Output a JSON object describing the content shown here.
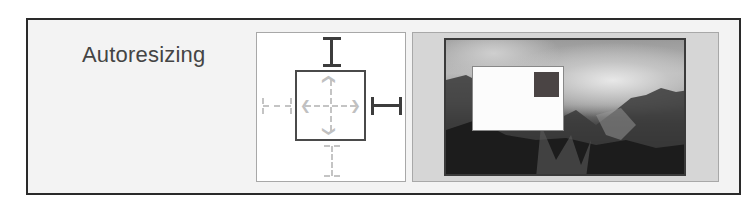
{
  "section": {
    "label": "Autoresizing"
  },
  "autoresizing_control": {
    "struts": {
      "top": "enabled",
      "right": "enabled",
      "bottom": "disabled",
      "left": "disabled"
    },
    "springs": {
      "width": "disabled",
      "height": "disabled"
    },
    "icons": {
      "top_strut": "i-beam-vertical-icon",
      "right_strut": "i-beam-horizontal-icon",
      "inner_springs": "dashed-arrow-icon"
    }
  },
  "preview": {
    "background": "mountain-landscape-image",
    "sample_view_color": "#fcfcfc",
    "sample_square_color": "#4a4444"
  },
  "colors": {
    "panel_border": "#2a2a2a",
    "panel_bg": "#f3f3f3",
    "label_text": "#444444",
    "strut_active": "#3c3c3c",
    "strut_inactive": "#c4c4c4"
  }
}
